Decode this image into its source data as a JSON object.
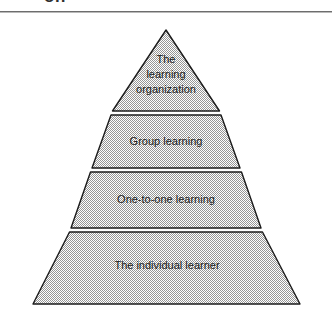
{
  "figure": {
    "caption_partial": "on",
    "background_color": "#ffffff",
    "rule_color": "#6d6d6d"
  },
  "pyramid": {
    "fill_color": "#c9c9c9",
    "outline_color": "#1b1b1b",
    "gap_color": "#ffffff",
    "apex": {
      "x": 166,
      "y": 30
    },
    "base": {
      "left_x": 33,
      "right_x": 300,
      "y": 305
    },
    "levels": [
      {
        "index": 1,
        "label": "The\nlearning\norganization",
        "label_flat": "The learning organization",
        "top_y": 30,
        "bottom_y": 113
      },
      {
        "index": 2,
        "label": "Group learning",
        "label_flat": "Group learning",
        "top_y": 113,
        "bottom_y": 170
      },
      {
        "index": 3,
        "label": "One-to-one learning",
        "label_flat": "One-to-one learning",
        "top_y": 170,
        "bottom_y": 230
      },
      {
        "index": 4,
        "label": "The individual learner",
        "label_flat": "The individual learner",
        "top_y": 230,
        "bottom_y": 305
      }
    ]
  }
}
